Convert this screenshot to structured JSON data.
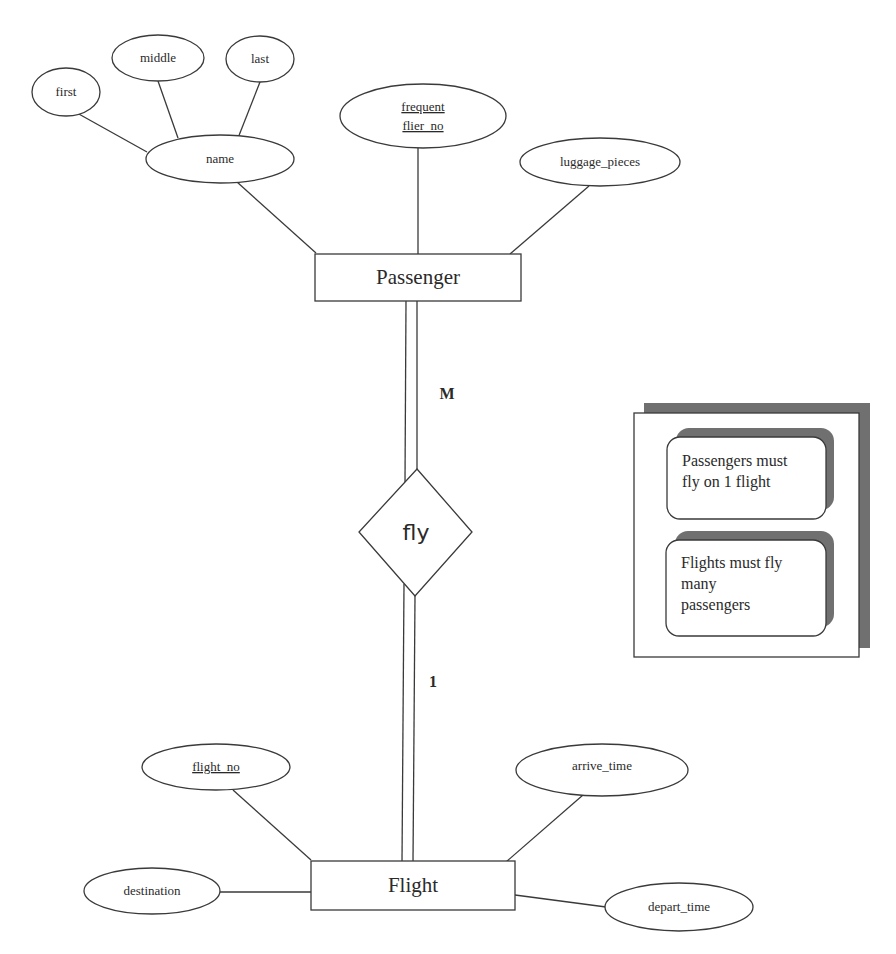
{
  "diagram": {
    "type": "ER diagram",
    "entities": [
      {
        "id": "passenger",
        "label": "Passenger"
      },
      {
        "id": "flight",
        "label": "Flight"
      }
    ],
    "relationship": {
      "id": "fly",
      "label": "fly"
    },
    "cardinality": {
      "passenger_side": "M",
      "flight_side": "1"
    },
    "attributes": {
      "passenger": [
        {
          "label": "name",
          "key": false,
          "composite_parts": [
            "first",
            "middle",
            "last"
          ]
        },
        {
          "label": "frequent",
          "label2": "flier_no",
          "key": true
        },
        {
          "label": "luggage_pieces",
          "key": false
        }
      ],
      "name_parts": {
        "first": "first",
        "middle": "middle",
        "last": "last"
      },
      "flight": [
        {
          "label": "flight_no",
          "key": true
        },
        {
          "label": "destination",
          "key": false
        },
        {
          "label": "arrive_time",
          "key": false
        },
        {
          "label": "depart_time",
          "key": false
        }
      ]
    },
    "notes": [
      {
        "lines": [
          "Passengers must",
          "fly on 1 flight"
        ]
      },
      {
        "lines": [
          "Flights must fly",
          "many",
          "passengers"
        ]
      }
    ],
    "colors": {
      "stroke": "#3a3a3a",
      "shadow": "#707070",
      "background": "#ffffff"
    }
  }
}
